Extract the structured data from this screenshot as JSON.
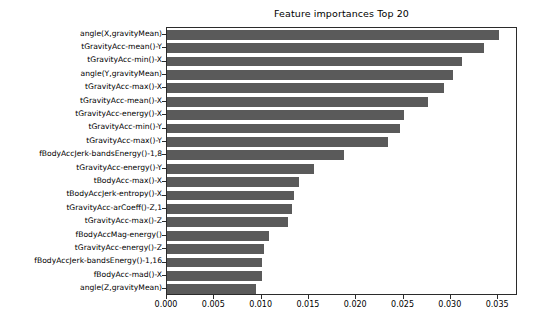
{
  "chart_data": {
    "type": "bar",
    "orientation": "horizontal",
    "title": "Feature importances Top 20",
    "xlabel": "",
    "ylabel": "",
    "xlim": [
      0.0,
      0.0371
    ],
    "grid": false,
    "legend": null,
    "bar_color": "#5a5a5a",
    "xticks": [
      "0.000",
      "0.005",
      "0.010",
      "0.015",
      "0.020",
      "0.025",
      "0.030",
      "0.035"
    ],
    "xtick_values": [
      0.0,
      0.005,
      0.01,
      0.015,
      0.02,
      0.025,
      0.03,
      0.035
    ],
    "categories": [
      "angle(X,gravityMean)",
      "tGravityAcc-mean()-Y",
      "tGravityAcc-min()-X",
      "angle(Y,gravityMean)",
      "tGravityAcc-max()-X",
      "tGravityAcc-mean()-X",
      "tGravityAcc-energy()-X",
      "tGravityAcc-min()-Y",
      "tGravityAcc-max()-Y",
      "fBodyAccJerk-bandsEnergy()-1,8",
      "tGravityAcc-energy()-Y",
      "tBodyAcc-max()-X",
      "tBodyAccJerk-entropy()-X",
      "tGravityAcc-arCoeff()-Z,1",
      "tGravityAcc-max()-Z",
      "fBodyAccMag-energy()",
      "tGravityAcc-energy()-Z",
      "fBodyAccJerk-bandsEnergy()-1,16",
      "fBodyAcc-mad()-X",
      "angle(Z,gravityMean)"
    ],
    "values": [
      0.0351,
      0.0335,
      0.0312,
      0.0302,
      0.0293,
      0.0276,
      0.0251,
      0.0246,
      0.0234,
      0.0187,
      0.0155,
      0.0139,
      0.0134,
      0.0132,
      0.0128,
      0.0108,
      0.0102,
      0.01,
      0.01,
      0.0094
    ]
  }
}
